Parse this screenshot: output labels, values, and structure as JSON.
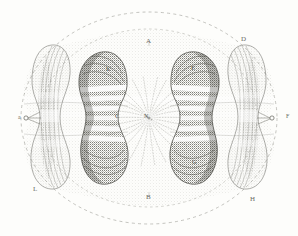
{
  "figure": {
    "title": "Karyokinesis — dividing cell with two daughter nuclei",
    "medium": "stipple / line engraving, monochrome grey on off-white",
    "background_color": "#fdfdfb",
    "ink_color": "#5a5a54",
    "width_px": 298,
    "height_px": 236
  },
  "labels": {
    "top_center": "A",
    "bottom_center": "B",
    "upper_right": "D",
    "right_inner_upper": "E",
    "right_edge": "F",
    "right_inner_lower": "G",
    "bottom_right": "H",
    "bottom_left": "L",
    "left_inner_upper": "K",
    "left_inner_lower": "C",
    "left_edge": "a",
    "center": "N"
  },
  "structures": [
    {
      "name": "outer-dashed-circle",
      "role": "cell membrane outline",
      "style": "dashed arc"
    },
    {
      "name": "inner-dashed-circle",
      "role": "inner cytoplasmic boundary",
      "style": "dashed arc"
    },
    {
      "name": "central-aster",
      "role": "spindle centre with radiating achromatic fibres",
      "style": "dotted radial rays"
    },
    {
      "name": "left-inner-chromosome-mass",
      "role": "daughter chromosome group",
      "style": "dense stipple with pale transverse bands"
    },
    {
      "name": "right-inner-chromosome-mass",
      "role": "daughter chromosome group",
      "style": "dense stipple with pale transverse bands"
    },
    {
      "name": "left-outer-lobe",
      "role": "peripheral protoplasmic lobe",
      "style": "light stipple, fibrous striation"
    },
    {
      "name": "right-outer-lobe",
      "role": "peripheral protoplasmic lobe",
      "style": "light stipple, fibrous striation"
    },
    {
      "name": "cytoplasm-field",
      "role": "stippled granular cytoplasm",
      "style": "fine stipple wash"
    }
  ]
}
